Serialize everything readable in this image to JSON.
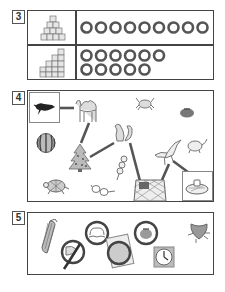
{
  "sections": [
    {
      "number": "3",
      "title": "Count the cubes",
      "rows": [
        {
          "figure": "cube-staircase-pyramid",
          "circle_count": 9,
          "circle_rows": [
            9
          ]
        },
        {
          "figure": "cube-staircase-tower",
          "circle_count": 11,
          "circle_rows": [
            6,
            5
          ]
        }
      ]
    },
    {
      "number": "4",
      "title": "Word chain path",
      "start": "crow",
      "end": "ramen-bowl",
      "items": [
        "crow",
        "camel",
        "crab",
        "persimmon",
        "watermelon",
        "squirrel",
        "christmas-tree",
        "dango",
        "seagull",
        "mouse",
        "turtle",
        "glasses",
        "net-bag",
        "ramen-bowl"
      ],
      "path": [
        "crow",
        "camel",
        "christmas-tree",
        "squirrel",
        "net-bag",
        "seagull",
        "ramen-bowl"
      ]
    },
    {
      "number": "5",
      "title": "Circled items",
      "items": [
        "corn",
        "fish-crossed",
        "peach-circled",
        "photo-circled",
        "tomato-circled",
        "clock",
        "bug"
      ]
    }
  ],
  "colors": {
    "border": "#444444",
    "line": "#555555",
    "circle": "#555555",
    "highlight_box": "#888888"
  }
}
